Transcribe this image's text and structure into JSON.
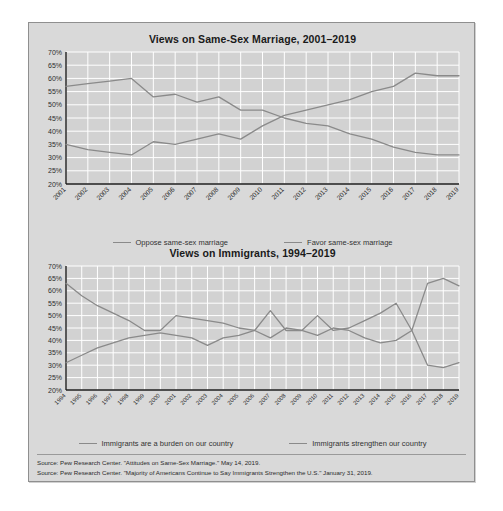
{
  "slide": {
    "sources": [
      "Source: Pew Research Center. \"Attitudes on Same-Sex Marriage.\" May 14, 2019.",
      "Source: Pew Research Center. \"Majority of Americans Continue to Say Immigrants Strengthen the U.S.\" January 31, 2019."
    ]
  },
  "chart_data": [
    {
      "type": "line",
      "title": "Views on Same-Sex Marriage, 2001–2019",
      "xlabel": "",
      "ylabel": "",
      "ylim": [
        20,
        70
      ],
      "ytick_step": 5,
      "ytick_labels": [
        "20%",
        "25%",
        "30%",
        "35%",
        "40%",
        "45%",
        "50%",
        "55%",
        "60%",
        "65%",
        "70%"
      ],
      "grid": true,
      "legend_position": "bottom",
      "categories": [
        "2001",
        "2002",
        "2003",
        "2004",
        "2005",
        "2006",
        "2007",
        "2008",
        "2009",
        "2010",
        "2011",
        "2012",
        "2013",
        "2014",
        "2015",
        "2016",
        "2017",
        "2018",
        "2019"
      ],
      "series": [
        {
          "name": "Oppose same-sex marriage",
          "color": "#8a8a8a",
          "values": [
            57,
            58,
            59,
            60,
            53,
            54,
            51,
            53,
            48,
            48,
            45,
            43,
            42,
            39,
            37,
            34,
            32,
            31,
            31
          ]
        },
        {
          "name": "Favor same-sex marriage",
          "color": "#8a8a8a",
          "values": [
            35,
            33,
            32,
            31,
            36,
            35,
            37,
            39,
            37,
            42,
            46,
            48,
            50,
            52,
            55,
            57,
            62,
            61,
            61
          ]
        }
      ]
    },
    {
      "type": "line",
      "title": "Views on Immigrants, 1994–2019",
      "xlabel": "",
      "ylabel": "",
      "ylim": [
        20,
        70
      ],
      "ytick_step": 5,
      "ytick_labels": [
        "20%",
        "25%",
        "30%",
        "35%",
        "40%",
        "45%",
        "50%",
        "55%",
        "60%",
        "65%",
        "70%"
      ],
      "grid": true,
      "legend_position": "bottom",
      "categories": [
        "1994",
        "1995",
        "1996",
        "1997",
        "1998",
        "1999",
        "2000",
        "2001",
        "2002",
        "2003",
        "2004",
        "2005",
        "2006",
        "2007",
        "2008",
        "2009",
        "2010",
        "2011",
        "2012",
        "2013",
        "2014",
        "2015",
        "2016",
        "2017",
        "2018",
        "2019"
      ],
      "series": [
        {
          "name": "Immigrants are a burden on our country",
          "color": "#8a8a8a",
          "values": [
            63,
            58,
            54,
            51,
            48,
            44,
            44,
            50,
            49,
            48,
            47,
            45,
            44,
            52,
            44,
            44,
            50,
            44,
            45,
            48,
            51,
            55,
            44,
            63,
            65,
            62
          ]
        },
        {
          "name": "Immigrants strengthen our country",
          "color": "#8a8a8a",
          "values": [
            31,
            34,
            37,
            39,
            41,
            42,
            43,
            42,
            41,
            38,
            41,
            42,
            44,
            41,
            45,
            44,
            42,
            45,
            44,
            41,
            39,
            40,
            44,
            30,
            29,
            31
          ]
        }
      ]
    }
  ]
}
